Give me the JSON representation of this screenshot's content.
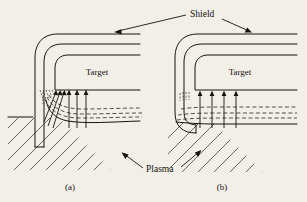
{
  "figure": {
    "background_color": "#f2efe9",
    "ink_color": "#17140f",
    "labels": {
      "shield": "Shield",
      "plasma": "Plasma",
      "target_a": "Target",
      "target_b": "Target",
      "caption_a": "(a)",
      "caption_b": "(b)"
    }
  },
  "diagram_data": {
    "type": "technical-schematic",
    "description": "Two side-by-side cross-section schematics of a sputtering target with a surrounding grounded shield immersed in plasma; dashed curves are electric-field/sheath contours and solid arrows are ion trajectories striking the target surface.",
    "panels": [
      {
        "id": "a",
        "caption": "(a)",
        "target_label": "Target",
        "shield_style": "straight-leg",
        "shield_note": "Shield wall runs straight down past the target edge deep into the plasma region.",
        "ion_arrows": 6,
        "ion_arrow_kinds": [
          "slanted",
          "slanted",
          "slanted",
          "vertical",
          "vertical",
          "vertical"
        ],
        "sheath_contours": 4,
        "plasma_hatched": true
      },
      {
        "id": "b",
        "caption": "(b)",
        "target_label": "Target",
        "shield_style": "hooked-leg",
        "shield_note": "Shield wall terminates short and curves back inward in a J-hook near the plasma boundary.",
        "ion_arrows": 4,
        "ion_arrow_kinds": [
          "vertical",
          "vertical",
          "vertical",
          "vertical"
        ],
        "sheath_contours": 3,
        "plasma_hatched": true
      }
    ],
    "annotations": [
      {
        "text": "Shield",
        "points_to": [
          "panel-a-shield-top",
          "panel-b-shield-top"
        ]
      },
      {
        "text": "Plasma",
        "points_to": [
          "panel-a-plasma-region",
          "panel-b-plasma-region"
        ]
      }
    ]
  }
}
